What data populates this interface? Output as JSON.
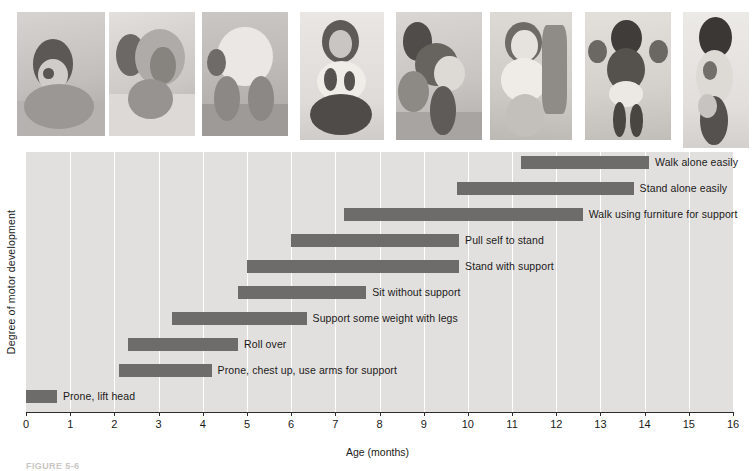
{
  "figure": {
    "caption": "FIGURE 5-6"
  },
  "chart_data": {
    "type": "bar",
    "orientation": "horizontal-range",
    "title": "",
    "xlabel": "Age (months)",
    "ylabel": "Degree of motor development",
    "xlim": [
      0,
      16
    ],
    "xticks": [
      0,
      1,
      2,
      3,
      4,
      5,
      6,
      7,
      8,
      9,
      10,
      11,
      12,
      13,
      14,
      15,
      16
    ],
    "grid": "vertical",
    "legend": "none",
    "bar_color": "#6e6c6b",
    "plot_background": "#e2e0de",
    "categories": [
      "Walk alone easily",
      "Stand alone easily",
      "Walk using furniture for support",
      "Pull self to stand",
      "Stand with support",
      "Sit without support",
      "Support some weight with legs",
      "Roll over",
      "Prone, chest up, use arms for support",
      "Prone, lift head"
    ],
    "bars": [
      {
        "label": "Walk alone easily",
        "start": 11.2,
        "end": 14.1
      },
      {
        "label": "Stand alone easily",
        "start": 9.75,
        "end": 13.75
      },
      {
        "label": "Walk using furniture for support",
        "start": 7.2,
        "end": 12.6
      },
      {
        "label": "Pull self to stand",
        "start": 6.0,
        "end": 9.8
      },
      {
        "label": "Stand with support",
        "start": 5.0,
        "end": 9.8
      },
      {
        "label": "Sit without support",
        "start": 4.8,
        "end": 7.7
      },
      {
        "label": "Support some weight with legs",
        "start": 3.3,
        "end": 6.35
      },
      {
        "label": "Roll over",
        "start": 2.3,
        "end": 4.8
      },
      {
        "label": "Prone, chest up, use arms for support",
        "start": 2.1,
        "end": 4.2
      },
      {
        "label": "Prone, lift head",
        "start": 0.0,
        "end": 0.7
      }
    ]
  },
  "photo_strip": {
    "alt_group": "black-and-white photographs of infants at successive motor milestones",
    "photos": [
      {
        "name": "infant-prone-lift-head-photo",
        "milestone": "Prone, lift head"
      },
      {
        "name": "infant-rolling-over-photo",
        "milestone": "Roll over"
      },
      {
        "name": "infant-crawling-photo",
        "milestone": "Support some weight with legs"
      },
      {
        "name": "infant-sitting-photo",
        "milestone": "Sit without support"
      },
      {
        "name": "infant-pull-to-stand-photo",
        "milestone": "Pull self to stand"
      },
      {
        "name": "infant-cruising-furniture-photo",
        "milestone": "Walk using furniture for support"
      },
      {
        "name": "infant-walking-with-help-photo",
        "milestone": "Stand alone easily"
      },
      {
        "name": "toddler-walking-alone-photo",
        "milestone": "Walk alone easily"
      }
    ]
  }
}
